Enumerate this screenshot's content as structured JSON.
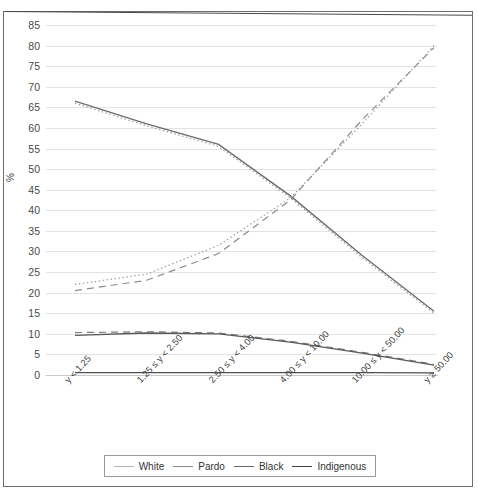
{
  "chart_data": {
    "type": "line",
    "title": "",
    "subtitle": "",
    "xlabel": "",
    "ylabel": "%",
    "ylim": [
      0,
      85
    ],
    "yticks": [
      0,
      5,
      10,
      15,
      20,
      25,
      30,
      35,
      40,
      45,
      50,
      55,
      60,
      65,
      70,
      75,
      80,
      85
    ],
    "grid": true,
    "legend_position": "bottom",
    "categories": [
      "y < 1.25",
      "1.25 ≤ y < 2.50",
      "2.50 ≤ y < 4.00",
      "4.00 ≤ y < 10.00",
      "10.00 ≤ y < 50.00",
      "y ≥ 50.00"
    ],
    "series": [
      {
        "name": "White",
        "style": "dashed",
        "color": "#8c8c8c",
        "values": [
          20.5,
          23.0,
          29.5,
          42.5,
          62.0,
          79.5
        ]
      },
      {
        "name": "Pardo",
        "style": "solid",
        "color": "#6b6b6b",
        "values": [
          66.5,
          61.0,
          56.0,
          43.5,
          29.0,
          15.5
        ]
      },
      {
        "name": "Black",
        "style": "dashed",
        "color": "#7a7a7a",
        "values": [
          10.3,
          10.5,
          10.2,
          8.2,
          5.5,
          2.6
        ]
      },
      {
        "name": "Indigenous",
        "style": "solid",
        "color": "#4f4f4f",
        "values": [
          0.6,
          0.6,
          0.6,
          0.6,
          0.6,
          0.5
        ]
      },
      {
        "name": "White (dotted)",
        "style": "dotted",
        "color": "#9a9a9a",
        "values": [
          22.0,
          24.5,
          31.5,
          43.0,
          61.0,
          80.0
        ]
      },
      {
        "name": "Pardo (dotted)",
        "style": "dotted",
        "color": "#9a9a9a",
        "values": [
          66.0,
          60.5,
          55.5,
          43.0,
          28.5,
          15.0
        ]
      },
      {
        "name": "Black (solid)",
        "style": "solid",
        "color": "#5a5a5a",
        "values": [
          9.6,
          10.2,
          10.0,
          8.0,
          5.3,
          2.4
        ]
      }
    ]
  },
  "legend": {
    "items": [
      {
        "label": "White",
        "color": "#b4b4b4"
      },
      {
        "label": "Pardo",
        "color": "#8a8a8a"
      },
      {
        "label": "Black",
        "color": "#6a6a6a"
      },
      {
        "label": "Indigenous",
        "color": "#3f3f3f"
      }
    ]
  }
}
